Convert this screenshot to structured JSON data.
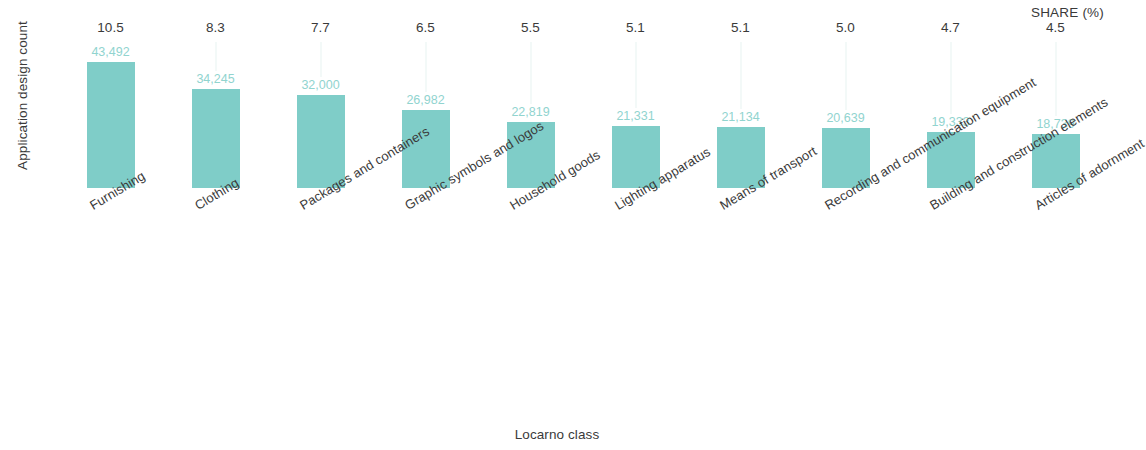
{
  "chart_data": {
    "type": "bar",
    "title": "",
    "subtitle": "",
    "xlabel": "Locarno class",
    "ylabel": "Application design count",
    "secondary_label": "SHARE (%)",
    "grid": false,
    "legend": "none",
    "ylim": [
      0,
      43492
    ],
    "categories": [
      "Furnishing",
      "Clothing",
      "Packages and containers",
      "Graphic symbols and logos",
      "Household goods",
      "Lighting apparatus",
      "Means of transport",
      "Recording and communication equipment",
      "Building and construction elements",
      "Articles of adornment"
    ],
    "values": [
      43492,
      34245,
      32000,
      26982,
      22819,
      21331,
      21134,
      20639,
      19333,
      18739
    ],
    "value_labels": [
      "43,492",
      "34,245",
      "32,000",
      "26,982",
      "22,819",
      "21,331",
      "21,134",
      "20,639",
      "19,333",
      "18,739"
    ],
    "share_pct": [
      10.5,
      8.3,
      7.7,
      6.5,
      5.5,
      5.1,
      5.1,
      5.0,
      4.7,
      4.5
    ],
    "share_labels": [
      "10.5",
      "8.3",
      "7.7",
      "6.5",
      "5.5",
      "5.1",
      "5.1",
      "5.0",
      "4.7",
      "4.5"
    ],
    "colors": {
      "bar": "#7fcdc8",
      "value_label": "#91d4cf",
      "text": "#3a3a3a",
      "background": "#ffffff"
    }
  }
}
